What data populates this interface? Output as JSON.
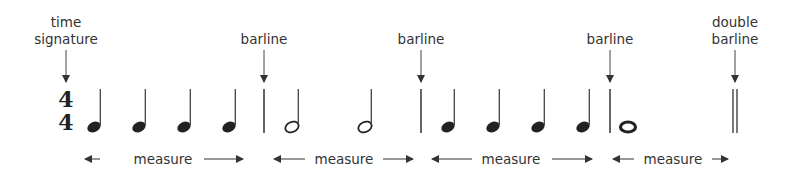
{
  "diagram": {
    "title": "",
    "time_signature": {
      "top": "4",
      "bottom": "4",
      "label_line1": "time",
      "label_line2": "signature"
    },
    "barline_label": "barline",
    "double_barline_label": {
      "line1": "double",
      "line2": "barline"
    },
    "measure_label": "measure",
    "measures": [
      {
        "notes": [
          "quarter",
          "quarter",
          "quarter",
          "quarter"
        ]
      },
      {
        "notes": [
          "half",
          "half"
        ]
      },
      {
        "notes": [
          "quarter",
          "quarter",
          "quarter",
          "quarter"
        ]
      },
      {
        "notes": [
          "whole"
        ]
      }
    ],
    "ink_color": "#222222",
    "arrow_color": "#333333"
  }
}
